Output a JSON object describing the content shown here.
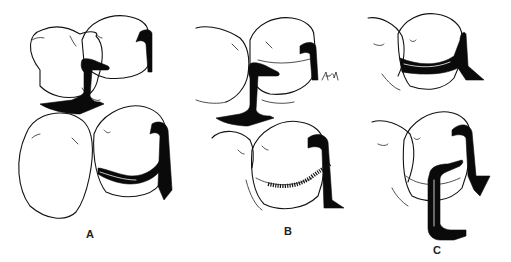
{
  "figure": {
    "colors": {
      "ink": "#0a0a0a",
      "background": "#ffffff"
    },
    "panels": [
      {
        "id": "A",
        "label": "A",
        "content": "T-band matrix with wedge; top and bottom views"
      },
      {
        "id": "B",
        "label": "B",
        "content": "T-band matrix with wedge; bottom view shows serrated band edge"
      },
      {
        "id": "C",
        "label": "C",
        "content": "Matrix band with separate retainer strip"
      }
    ],
    "signature": "Ard."
  }
}
